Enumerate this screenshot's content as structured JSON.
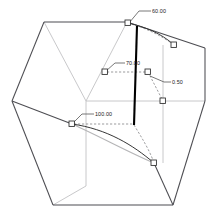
{
  "figure": {
    "title": "",
    "background_color": "#ffffff"
  },
  "colors": {
    "cube_dark_edge": "#4d4d52",
    "cube_light_edge": "#c2c2c4",
    "curve_dark": "#2b2b2b",
    "curve_light": "#b5b5b7",
    "thick_line": "#000000",
    "leader_line": "#555555",
    "dashed_line": "#8a8a8c",
    "marker_stroke": "#2a2a2a",
    "marker_fill": "#ffffff",
    "label_text": "#1a1a1a"
  },
  "labels": [
    {
      "id": "label-60",
      "text": "60.00",
      "x": 152,
      "y": 9
    },
    {
      "id": "label-70",
      "text": "70.00",
      "x": 126,
      "y": 62
    },
    {
      "id": "label-100",
      "text": "100.00",
      "x": 95,
      "y": 113
    },
    {
      "id": "label-050",
      "text": "0.50",
      "x": 172,
      "y": 81
    }
  ],
  "cube": {
    "vertices": {
      "top_back_left": {
        "x": 44,
        "y": 22
      },
      "top_back_right": {
        "x": 127,
        "y": 22
      },
      "top_right_far": {
        "x": 205,
        "y": 48
      },
      "top_apex_mid": {
        "x": 86,
        "y": 101
      },
      "left_mid": {
        "x": 12,
        "y": 101
      },
      "right_mid": {
        "x": 205,
        "y": 101
      },
      "bottom_front_left": {
        "x": 53,
        "y": 205
      },
      "bottom_front_right": {
        "x": 173,
        "y": 205
      },
      "bottom_apex": {
        "x": 145,
        "y": 163
      }
    }
  },
  "markers": [
    {
      "id": "node-top-left",
      "x": 128,
      "y": 23,
      "label_ref": "label-60"
    },
    {
      "id": "node-upper-right",
      "x": 174,
      "y": 45
    },
    {
      "id": "node-mid-left",
      "x": 105,
      "y": 72,
      "label_ref": "label-70"
    },
    {
      "id": "node-mid-center",
      "x": 148,
      "y": 72
    },
    {
      "id": "node-mid-right",
      "x": 163,
      "y": 101,
      "label_ref": "label-050"
    },
    {
      "id": "node-left-base",
      "x": 72,
      "y": 124,
      "label_ref": "label-100"
    },
    {
      "id": "node-bottom",
      "x": 154,
      "y": 163
    }
  ],
  "curves": {
    "upper_dark_arc": "M128,23 C145,27 160,33 174,45",
    "lower_dark_arc": "M72,124 C106,130 132,145 154,163",
    "lower_light_arc": "M72,124 C100,136 128,152 154,163",
    "thick_diagonal": "M137,26 L134,125",
    "dashed_upper_right": "M128,23 C146,28 162,36 174,45",
    "dashed_mid_to_node": "M148,72 L163,101",
    "dashed_lower_right": "M134,125 C142,138 149,151 154,163"
  },
  "leaders": [
    {
      "id": "leader-60",
      "path": "M128,23 L137,12 L150,12"
    },
    {
      "id": "leader-70",
      "path": "M105,72 L114,64 L124,64"
    },
    {
      "id": "leader-100",
      "path": "M72,124 L81,115 L93,115"
    },
    {
      "id": "leader-050",
      "path": "M150,76 L163,83 L171,83"
    }
  ],
  "dashed_connectors": [
    {
      "id": "dash-70-row",
      "path": "M107,72 L147,72"
    },
    {
      "id": "dash-100-row",
      "path": "M74,124 L133,124"
    }
  ]
}
